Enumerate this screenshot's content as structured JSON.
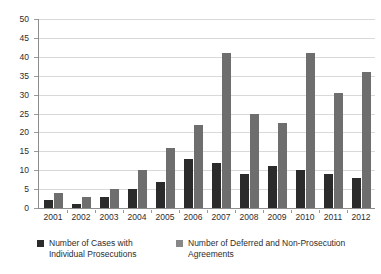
{
  "chart_data": {
    "type": "bar",
    "title": "",
    "subtitle": "",
    "xlabel": "",
    "ylabel": "",
    "ylim": [
      0,
      50
    ],
    "ytick_step": 5,
    "yticks": [
      50,
      45,
      40,
      35,
      30,
      25,
      20,
      15,
      10,
      5,
      0
    ],
    "grid": true,
    "legend_position": "bottom",
    "categories": [
      "2001",
      "2002",
      "2003",
      "2004",
      "2005",
      "2006",
      "2007",
      "2008",
      "2009",
      "2010",
      "2011",
      "2012"
    ],
    "series": [
      {
        "name": "Number of Cases with Individual Prosecutions",
        "color": "#2b2b2b",
        "values": [
          2,
          1,
          3,
          5,
          7,
          13,
          12,
          9,
          11,
          10,
          9,
          8
        ]
      },
      {
        "name": "Number of Deferred and Non-Prosecution Agreements",
        "color": "#6e6e6e",
        "values": [
          4,
          3,
          5,
          10,
          16,
          22,
          41,
          25,
          22.5,
          41,
          30.5,
          36
        ]
      }
    ]
  },
  "legend": {
    "items": [
      {
        "label": "Number of Cases with Individual Prosecutions",
        "swatch": "dark"
      },
      {
        "label": "Number of Deferred and Non-Prosecution Agreements",
        "swatch": "gray"
      }
    ]
  },
  "colors": {
    "series_dark": "#2b2b2b",
    "series_gray": "#6e6e6e",
    "gridline": "#d9d9d9",
    "axis": "#8d8d8d",
    "background": "#ffffff",
    "text": "#2d2d2d"
  }
}
